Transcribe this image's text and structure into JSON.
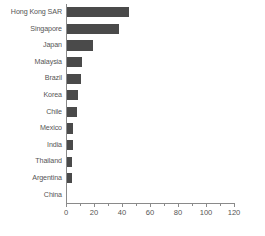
{
  "chart_data": {
    "type": "bar",
    "orientation": "horizontal",
    "title": "",
    "subtitle": "",
    "xlabel": "",
    "ylabel": "",
    "xlim": [
      0,
      120
    ],
    "ylim": null,
    "grid": false,
    "legend": null,
    "bar_color": "#4a4a4a",
    "axis_color": "#8a8a8a",
    "text_color": "#555555",
    "background_color": "#ffffff",
    "x_major_ticks": [
      0,
      20,
      40,
      60,
      80,
      100,
      120
    ],
    "x_minor_ticks": [
      10,
      30,
      50,
      70,
      90,
      110
    ],
    "x_tick_labels": [
      "0",
      "20",
      "40",
      "60",
      "80",
      "100",
      "120"
    ],
    "categories": [
      "Hong Kong SAR",
      "Singapore",
      "Japan",
      "Malaysia",
      "Brazil",
      "Korea",
      "Chile",
      "Mexico",
      "India",
      "Thailand",
      "Argentina",
      "China"
    ],
    "values": [
      44,
      37,
      18.5,
      11,
      10,
      7.5,
      7,
      4.5,
      4,
      3.5,
      3.5,
      0
    ]
  }
}
